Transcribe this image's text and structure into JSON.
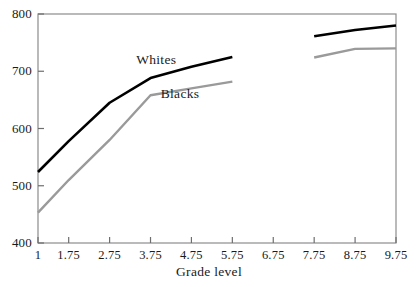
{
  "chart_data": {
    "type": "line",
    "title": "",
    "xlabel": "Grade level",
    "ylabel": "",
    "xlim": [
      1,
      9.75
    ],
    "ylim": [
      400,
      800
    ],
    "grid": false,
    "legend_position": "inline-annotation",
    "xticks": [
      "1",
      "1.75",
      "2.75",
      "3.75",
      "4.75",
      "5.75",
      "6.75",
      "7.75",
      "8.75",
      "9.75"
    ],
    "xtick_values": [
      1,
      1.75,
      2.75,
      3.75,
      4.75,
      5.75,
      6.75,
      7.75,
      8.75,
      9.75
    ],
    "yticks": [
      "400",
      "500",
      "600",
      "700",
      "800"
    ],
    "ytick_values": [
      400,
      500,
      600,
      700,
      800
    ],
    "series": [
      {
        "name": "Whites",
        "color": "#000000",
        "label_x": 3.4,
        "label_y": 718,
        "segments": [
          {
            "x": [
              1,
              1.75,
              2.75,
              3.75,
              4.75,
              5.75
            ],
            "values": [
              524,
              578,
              645,
              688,
              708,
              725
            ]
          },
          {
            "x": [
              7.75,
              8.75,
              9.75
            ],
            "values": [
              761,
              772,
              780
            ]
          }
        ]
      },
      {
        "name": "Blacks",
        "color": "#9a9a9a",
        "label_x": 4.0,
        "label_y": 658,
        "segments": [
          {
            "x": [
              1,
              1.75,
              2.75,
              3.75,
              4.75,
              5.75
            ],
            "values": [
              453,
              510,
              580,
              658,
              670,
              682
            ]
          },
          {
            "x": [
              7.75,
              8.75,
              9.75
            ],
            "values": [
              724,
              739,
              740
            ]
          }
        ]
      }
    ]
  },
  "axes": {
    "frame_color": "#8c8c8c",
    "tick_color": "#6e6e6e"
  },
  "xaxis": {
    "title": "Grade level"
  }
}
